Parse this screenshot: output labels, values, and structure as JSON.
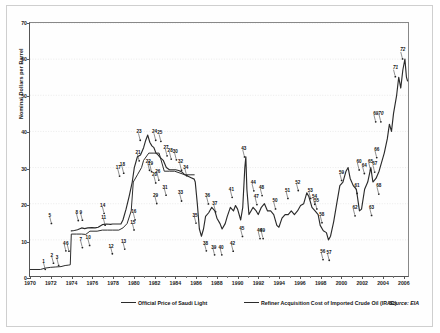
{
  "chart_data": {
    "type": "line",
    "title": "",
    "xlabel": "",
    "ylabel": "Nominal Dollars per Barrel",
    "xlim": [
      1970,
      2006.6
    ],
    "ylim": [
      0,
      70
    ],
    "yticks": [
      0,
      10,
      20,
      30,
      40,
      50,
      60,
      70
    ],
    "xticks": [
      1970,
      1972,
      1974,
      1976,
      1978,
      1980,
      1982,
      1984,
      1986,
      1988,
      1990,
      1992,
      1994,
      1996,
      1998,
      2000,
      2002,
      2004,
      2006
    ],
    "grid": "horizontal-dotted",
    "legend_position": "bottom",
    "source": "Source: EIA",
    "series": [
      {
        "name": "Official Price of Saudi Light",
        "points": [
          [
            1970.0,
            1.8
          ],
          [
            1971.0,
            1.8
          ],
          [
            1971.5,
            2.2
          ],
          [
            1972.0,
            2.4
          ],
          [
            1972.5,
            2.5
          ],
          [
            1973.0,
            2.6
          ],
          [
            1973.4,
            2.9
          ],
          [
            1973.7,
            3.0
          ],
          [
            1973.9,
            3.1
          ],
          [
            1974.0,
            11.6
          ],
          [
            1974.5,
            11.6
          ],
          [
            1975.0,
            11.6
          ],
          [
            1975.4,
            11.5
          ],
          [
            1975.8,
            12.4
          ],
          [
            1976.0,
            12.4
          ],
          [
            1976.5,
            12.4
          ],
          [
            1977.0,
            12.7
          ],
          [
            1977.5,
            12.7
          ],
          [
            1978.0,
            12.7
          ],
          [
            1978.6,
            12.7
          ],
          [
            1979.0,
            13.3
          ],
          [
            1979.4,
            14.5
          ],
          [
            1979.8,
            18.0
          ],
          [
            1980.0,
            26.0
          ],
          [
            1980.4,
            28.0
          ],
          [
            1980.8,
            30.0
          ],
          [
            1981.0,
            32.0
          ],
          [
            1981.5,
            34.0
          ],
          [
            1982.0,
            34.0
          ],
          [
            1982.5,
            34.0
          ],
          [
            1983.0,
            29.0
          ],
          [
            1983.5,
            29.0
          ],
          [
            1984.0,
            29.0
          ],
          [
            1985.0,
            28.0
          ],
          [
            1985.5,
            28.0
          ],
          [
            1985.9,
            28.0
          ]
        ]
      },
      {
        "name": "Refiner Acquisition Cost of Imported Crude Oil (IRAC)",
        "points": [
          [
            1974.0,
            12.5
          ],
          [
            1974.3,
            12.6
          ],
          [
            1974.6,
            12.8
          ],
          [
            1975.0,
            13.3
          ],
          [
            1975.3,
            13.1
          ],
          [
            1975.6,
            13.3
          ],
          [
            1976.0,
            13.4
          ],
          [
            1976.3,
            13.3
          ],
          [
            1976.6,
            13.5
          ],
          [
            1977.0,
            14.2
          ],
          [
            1977.4,
            14.4
          ],
          [
            1977.8,
            14.3
          ],
          [
            1978.0,
            14.4
          ],
          [
            1978.4,
            14.4
          ],
          [
            1978.8,
            14.4
          ],
          [
            1979.0,
            15.5
          ],
          [
            1979.3,
            18.5
          ],
          [
            1979.6,
            22.0
          ],
          [
            1979.9,
            26.0
          ],
          [
            1980.1,
            30.0
          ],
          [
            1980.4,
            33.0
          ],
          [
            1980.7,
            33.5
          ],
          [
            1981.0,
            35.5
          ],
          [
            1981.2,
            37.5
          ],
          [
            1981.4,
            39.0
          ],
          [
            1981.6,
            37.0
          ],
          [
            1981.8,
            36.0
          ],
          [
            1982.0,
            35.5
          ],
          [
            1982.2,
            34.0
          ],
          [
            1982.4,
            33.5
          ],
          [
            1982.6,
            32.8
          ],
          [
            1982.9,
            32.0
          ],
          [
            1983.2,
            30.0
          ],
          [
            1983.5,
            29.4
          ],
          [
            1983.8,
            29.4
          ],
          [
            1984.1,
            29.4
          ],
          [
            1984.4,
            29.2
          ],
          [
            1984.7,
            28.8
          ],
          [
            1985.0,
            28.0
          ],
          [
            1985.3,
            27.6
          ],
          [
            1985.6,
            27.2
          ],
          [
            1985.9,
            26.8
          ],
          [
            1986.0,
            26.0
          ],
          [
            1986.2,
            20.0
          ],
          [
            1986.4,
            13.0
          ],
          [
            1986.6,
            11.0
          ],
          [
            1986.8,
            13.0
          ],
          [
            1987.0,
            16.5
          ],
          [
            1987.3,
            17.5
          ],
          [
            1987.6,
            19.0
          ],
          [
            1987.9,
            18.0
          ],
          [
            1988.1,
            16.0
          ],
          [
            1988.4,
            14.5
          ],
          [
            1988.6,
            13.0
          ],
          [
            1988.9,
            14.5
          ],
          [
            1989.1,
            16.5
          ],
          [
            1989.4,
            19.0
          ],
          [
            1989.7,
            18.0
          ],
          [
            1989.9,
            19.5
          ],
          [
            1990.1,
            18.5
          ],
          [
            1990.4,
            15.5
          ],
          [
            1990.6,
            19.0
          ],
          [
            1990.8,
            30.0
          ],
          [
            1990.9,
            33.0
          ],
          [
            1991.0,
            24.0
          ],
          [
            1991.2,
            17.0
          ],
          [
            1991.4,
            18.0
          ],
          [
            1991.6,
            19.0
          ],
          [
            1991.9,
            18.0
          ],
          [
            1992.1,
            17.0
          ],
          [
            1992.4,
            19.0
          ],
          [
            1992.7,
            20.0
          ],
          [
            1993.0,
            18.0
          ],
          [
            1993.3,
            18.0
          ],
          [
            1993.6,
            17.0
          ],
          [
            1993.9,
            14.0
          ],
          [
            1994.1,
            13.5
          ],
          [
            1994.4,
            16.0
          ],
          [
            1994.7,
            17.0
          ],
          [
            1995.0,
            17.0
          ],
          [
            1995.3,
            18.0
          ],
          [
            1995.6,
            17.0
          ],
          [
            1995.9,
            18.0
          ],
          [
            1996.2,
            19.5
          ],
          [
            1996.5,
            20.0
          ],
          [
            1996.8,
            23.0
          ],
          [
            1997.0,
            22.0
          ],
          [
            1997.3,
            19.0
          ],
          [
            1997.6,
            18.0
          ],
          [
            1997.9,
            17.0
          ],
          [
            1998.1,
            14.0
          ],
          [
            1998.4,
            12.5
          ],
          [
            1998.7,
            12.0
          ],
          [
            1998.9,
            10.0
          ],
          [
            1999.1,
            11.0
          ],
          [
            1999.4,
            15.0
          ],
          [
            1999.7,
            20.0
          ],
          [
            2000.0,
            25.0
          ],
          [
            2000.3,
            26.0
          ],
          [
            2000.6,
            29.0
          ],
          [
            2000.8,
            30.0
          ],
          [
            2001.0,
            27.0
          ],
          [
            2001.3,
            25.0
          ],
          [
            2001.6,
            24.0
          ],
          [
            2001.9,
            18.0
          ],
          [
            2002.1,
            18.5
          ],
          [
            2002.4,
            24.0
          ],
          [
            2002.7,
            26.0
          ],
          [
            2003.0,
            30.0
          ],
          [
            2003.2,
            26.0
          ],
          [
            2003.5,
            27.0
          ],
          [
            2003.8,
            29.0
          ],
          [
            2004.0,
            31.0
          ],
          [
            2004.3,
            34.0
          ],
          [
            2004.6,
            38.0
          ],
          [
            2004.8,
            42.0
          ],
          [
            2005.0,
            40.0
          ],
          [
            2005.2,
            45.0
          ],
          [
            2005.5,
            50.0
          ],
          [
            2005.7,
            55.0
          ],
          [
            2005.9,
            52.0
          ],
          [
            2006.1,
            57.0
          ],
          [
            2006.3,
            60.0
          ],
          [
            2006.45,
            55.0
          ],
          [
            2006.55,
            54.0
          ]
        ]
      }
    ],
    "annotations": [
      {
        "id": "1",
        "x": 1971.3,
        "y": 4.6
      },
      {
        "id": "2",
        "x": 1972.1,
        "y": 6.3
      },
      {
        "id": "3",
        "x": 1972.6,
        "y": 5.7
      },
      {
        "id": "4",
        "x": 1973.3,
        "y": 9.7
      },
      {
        "id": "5",
        "x": 1971.9,
        "y": 17.3
      },
      {
        "id": "6",
        "x": 1973.6,
        "y": 9.6
      },
      {
        "id": "7",
        "x": 1974.9,
        "y": 10.6
      },
      {
        "id": "8",
        "x": 1974.5,
        "y": 18.1
      },
      {
        "id": "9",
        "x": 1974.9,
        "y": 18.2
      },
      {
        "id": "10",
        "x": 1975.6,
        "y": 11.2
      },
      {
        "id": "11",
        "x": 1977.1,
        "y": 16.8
      },
      {
        "id": "12",
        "x": 1977.8,
        "y": 8.9
      },
      {
        "id": "13",
        "x": 1979.0,
        "y": 10.2
      },
      {
        "id": "14",
        "x": 1977.0,
        "y": 20.1
      },
      {
        "id": "15",
        "x": 1979.9,
        "y": 15.5
      },
      {
        "id": "16",
        "x": 1980.0,
        "y": 18.3
      },
      {
        "id": "17",
        "x": 1978.5,
        "y": 30.4
      },
      {
        "id": "18",
        "x": 1978.9,
        "y": 31.2
      },
      {
        "id": "19",
        "x": 1981.6,
        "y": 31.6
      },
      {
        "id": "20",
        "x": 1982.0,
        "y": 28.5
      },
      {
        "id": "21",
        "x": 1980.4,
        "y": 34.6
      },
      {
        "id": "22",
        "x": 1981.4,
        "y": 32.0
      },
      {
        "id": "23",
        "x": 1980.5,
        "y": 40.3
      },
      {
        "id": "24",
        "x": 1982.0,
        "y": 40.3
      },
      {
        "id": "25",
        "x": 1982.5,
        "y": 40.0
      },
      {
        "id": "26",
        "x": 1982.3,
        "y": 29.3
      },
      {
        "id": "27",
        "x": 1983.1,
        "y": 36.0
      },
      {
        "id": "28",
        "x": 1983.5,
        "y": 35.1
      },
      {
        "id": "29",
        "x": 1982.1,
        "y": 22.8
      },
      {
        "id": "30",
        "x": 1984.0,
        "y": 34.9
      },
      {
        "id": "31",
        "x": 1983.0,
        "y": 25.1
      },
      {
        "id": "32",
        "x": 1984.5,
        "y": 32.0
      },
      {
        "id": "33",
        "x": 1984.5,
        "y": 23.5
      },
      {
        "id": "34",
        "x": 1985.0,
        "y": 30.5
      },
      {
        "id": "35",
        "x": 1985.9,
        "y": 17.4
      },
      {
        "id": "36",
        "x": 1987.1,
        "y": 22.7
      },
      {
        "id": "37",
        "x": 1987.8,
        "y": 20.5
      },
      {
        "id": "38",
        "x": 1986.9,
        "y": 9.7
      },
      {
        "id": "39",
        "x": 1987.7,
        "y": 8.6
      },
      {
        "id": "40",
        "x": 1988.4,
        "y": 8.6
      },
      {
        "id": "41",
        "x": 1989.4,
        "y": 24.5
      },
      {
        "id": "42",
        "x": 1989.5,
        "y": 9.6
      },
      {
        "id": "43",
        "x": 1990.6,
        "y": 35.7
      },
      {
        "id": "44",
        "x": 1991.5,
        "y": 26.3
      },
      {
        "id": "45",
        "x": 1990.4,
        "y": 13.7
      },
      {
        "id": "46",
        "x": 1992.1,
        "y": 13.1
      },
      {
        "id": "47",
        "x": 1991.8,
        "y": 22.5
      },
      {
        "id": "48",
        "x": 1992.3,
        "y": 25.0
      },
      {
        "id": "49",
        "x": 1992.4,
        "y": 13.1
      },
      {
        "id": "50",
        "x": 1993.6,
        "y": 21.3
      },
      {
        "id": "51",
        "x": 1994.8,
        "y": 24.2
      },
      {
        "id": "52",
        "x": 1995.8,
        "y": 26.4
      },
      {
        "id": "53",
        "x": 1997.0,
        "y": 24.2
      },
      {
        "id": "54",
        "x": 1997.4,
        "y": 22.6
      },
      {
        "id": "55",
        "x": 1997.6,
        "y": 21.3
      },
      {
        "id": "56",
        "x": 1998.2,
        "y": 7.3
      },
      {
        "id": "57",
        "x": 1998.8,
        "y": 7.1
      },
      {
        "id": "58",
        "x": 1998.1,
        "y": 17.5
      },
      {
        "id": "59",
        "x": 2000.0,
        "y": 29.2
      },
      {
        "id": "60",
        "x": 2001.7,
        "y": 32.1
      },
      {
        "id": "61",
        "x": 2001.5,
        "y": 25.6
      },
      {
        "id": "62",
        "x": 2001.3,
        "y": 19.4
      },
      {
        "id": "63",
        "x": 2002.9,
        "y": 19.5
      },
      {
        "id": "64",
        "x": 2002.2,
        "y": 31.1
      },
      {
        "id": "65",
        "x": 2002.8,
        "y": 32.1
      },
      {
        "id": "66",
        "x": 2003.4,
        "y": 35.5
      },
      {
        "id": "67",
        "x": 2003.2,
        "y": 31.5
      },
      {
        "id": "68",
        "x": 2003.6,
        "y": 25.4
      },
      {
        "id": "69",
        "x": 2003.3,
        "y": 45.4
      },
      {
        "id": "70",
        "x": 2003.8,
        "y": 45.4,
        "italic": true
      },
      {
        "id": "71",
        "x": 2005.2,
        "y": 57.9,
        "italic": true
      },
      {
        "id": "72",
        "x": 2005.9,
        "y": 62.8,
        "italic": true
      }
    ]
  },
  "legend": {
    "items": [
      {
        "label": "Official Price of Saudi Light"
      },
      {
        "label": "Refiner Acquisition Cost of Imported Crude Oil (IRAC)"
      }
    ],
    "source": "Source: EIA"
  },
  "axes": {
    "ytitle": "Nominal Dollars per Barrel"
  },
  "colors": {
    "line": "#2b2b2b",
    "grid": "#e2e2e2",
    "frame": "#555555",
    "text": "#1c1c1c",
    "background": "#ffffff"
  }
}
